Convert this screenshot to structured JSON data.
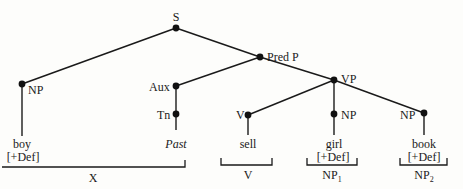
{
  "diagram": {
    "type": "syntax-tree",
    "nodes": {
      "S": "S",
      "PredP": "Pred P",
      "VP": "VP",
      "NP_subj": "NP",
      "Aux": "Aux",
      "Tn": "Tn",
      "V": "V",
      "NP_girl": "NP",
      "NP_book": "NP"
    },
    "leaves": {
      "boy": "boy",
      "boy_feat": "[+Def]",
      "past": "Past",
      "sell": "sell",
      "girl": "girl",
      "girl_feat": "[+Def]",
      "book": "book",
      "book_feat": "[+Def]"
    },
    "brackets": {
      "X": "X",
      "V": "V",
      "NP1_base": "NP",
      "NP1_sub": "1",
      "NP2_base": "NP",
      "NP2_sub": "2"
    },
    "edges": [
      [
        "S",
        "NP_subj"
      ],
      [
        "S",
        "PredP"
      ],
      [
        "PredP",
        "Aux"
      ],
      [
        "PredP",
        "VP"
      ],
      [
        "Aux",
        "Tn"
      ],
      [
        "Tn",
        "past"
      ],
      [
        "NP_subj",
        "boy"
      ],
      [
        "VP",
        "V"
      ],
      [
        "VP",
        "NP_girl"
      ],
      [
        "VP",
        "NP_book"
      ],
      [
        "V",
        "sell"
      ],
      [
        "NP_girl",
        "girl"
      ],
      [
        "NP_book",
        "book"
      ]
    ]
  }
}
